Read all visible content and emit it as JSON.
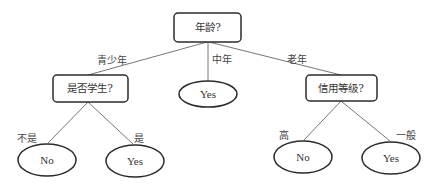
{
  "diagram": {
    "type": "decision-tree",
    "colors": {
      "background": "#ffffff",
      "stroke": "#2b2b2b",
      "edge": "#666666",
      "text": "#333333"
    },
    "root": {
      "label": "年龄?"
    },
    "edges_from_root": {
      "left": "青少年",
      "middle": "中年",
      "right": "老年"
    },
    "left_node": {
      "label": "是否学生?",
      "edges": {
        "left": "不是",
        "right": "是"
      },
      "leaves": {
        "left": "No",
        "right": "Yes"
      }
    },
    "middle_leaf": {
      "label": "Yes"
    },
    "right_node": {
      "label": "信用等级?",
      "edges": {
        "left": "高",
        "right": "一般"
      },
      "leaves": {
        "left": "No",
        "right": "Yes"
      }
    }
  }
}
